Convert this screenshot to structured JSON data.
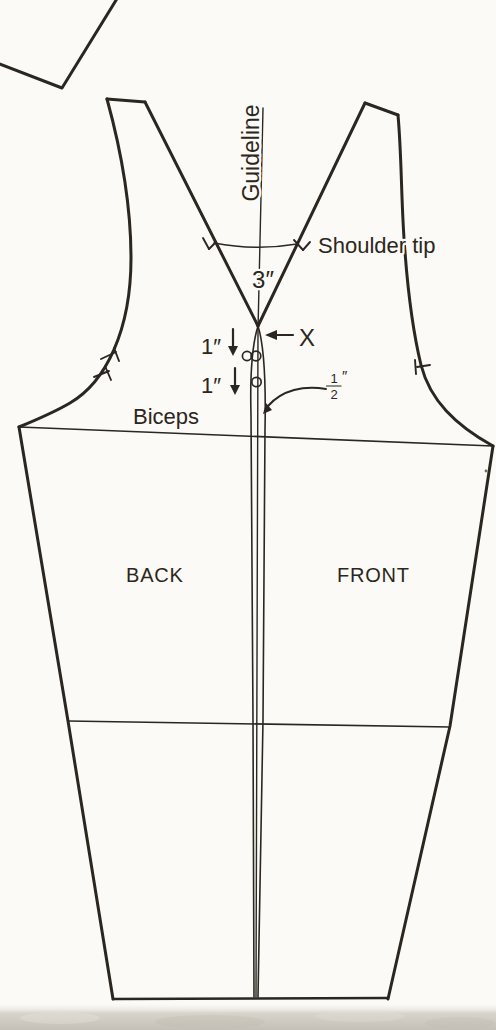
{
  "labels": {
    "guideline": "Guideline",
    "shoulder_tip": "Shoulder tip",
    "biceps": "Biceps",
    "back": "BACK",
    "front": "FRONT",
    "x_marker": "X"
  },
  "measurements": {
    "dart_spread": "3″",
    "drop_upper": "1″",
    "drop_lower": "1″",
    "half_inch_numerator": "1",
    "half_inch_denominator": "2",
    "half_inch_unit": "″"
  },
  "colors": {
    "ink": "#2b2620",
    "paper": "#fbfaf6",
    "page_edge_gray": "#c8c4bb"
  }
}
